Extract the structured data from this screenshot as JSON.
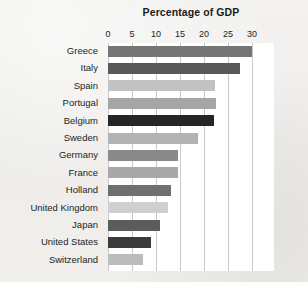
{
  "chart_data": {
    "type": "bar",
    "orientation": "horizontal",
    "title": "Percentage of GDP",
    "xlabel": "",
    "ylabel": "",
    "xlim": [
      0,
      30
    ],
    "xticks": [
      0,
      5,
      10,
      15,
      20,
      25,
      30
    ],
    "xtick_labels": [
      "0",
      "5",
      "10",
      "15",
      "20",
      "25",
      "30"
    ],
    "grid": "vertical",
    "legend": "none",
    "categories": [
      "Greece",
      "Italy",
      "Spain",
      "Portugal",
      "Belgium",
      "Sweden",
      "Germany",
      "France",
      "Holland",
      "United Kingdom",
      "Japan",
      "United States",
      "Switzerland"
    ],
    "values": [
      30,
      27.5,
      22.3,
      22.5,
      22,
      18.7,
      14.6,
      14.6,
      13.1,
      12.5,
      10.8,
      9,
      7.3
    ],
    "bar_colors": [
      "#757575",
      "#595959",
      "#c2c2c2",
      "#a5a5a5",
      "#262626",
      "#b3b3b3",
      "#8a8a8a",
      "#a8a8a8",
      "#6f6f6f",
      "#cfcfcf",
      "#5c5c5c",
      "#3b3b3b",
      "#bcbcbc"
    ]
  },
  "colors": {
    "page_background": "#f1f0ee",
    "plot_background": "#ffffff",
    "gridline": "#c9c9c9",
    "text": "#1d1d1d"
  }
}
